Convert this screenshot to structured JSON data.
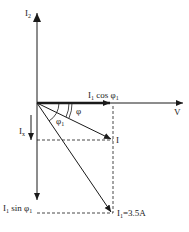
{
  "diagram": {
    "type": "phasor-diagram",
    "labels": {
      "i2_axis": "I",
      "i2_sub": "2",
      "v_axis": "V",
      "i1_cos_main": "I",
      "i1_cos_sub": "1",
      "i1_cos_rest": " cos φ",
      "i1_cos_rest_sub": "1",
      "phi": "φ",
      "phi1": "φ",
      "phi1_sub": "1",
      "ix_main": "I",
      "ix_sub": "x",
      "i_phasor": "I",
      "i1_sin_main": "I",
      "i1_sin_sub": "1",
      "i1_sin_rest": " sin φ",
      "i1_sin_rest_sub": "1",
      "i1_main": "I",
      "i1_sub": "1",
      "i1_value": "=3.5A"
    },
    "colors": {
      "line": "#1a1a1a",
      "background": "#ffffff"
    }
  }
}
